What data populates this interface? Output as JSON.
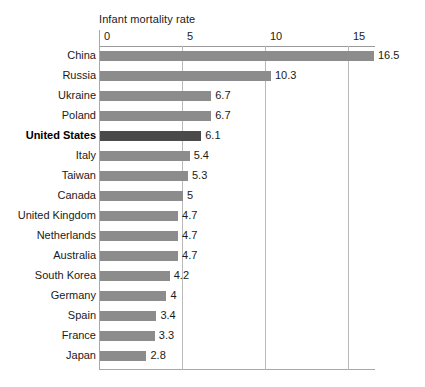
{
  "chart_data": {
    "type": "bar",
    "orientation": "horizontal",
    "title": "Infant mortality rate",
    "xlabel": "",
    "ylabel": "",
    "xlim": [
      0,
      16.6
    ],
    "xticks": [
      0,
      5,
      10,
      15
    ],
    "xtick_labels": [
      "0",
      "5",
      "10",
      "15"
    ],
    "grid": true,
    "legend": "none",
    "highlight_category": "United States",
    "colors": {
      "bar": "#8c8c8c",
      "bar_highlight": "#4a4a4a",
      "gridline": "#b9b9b9",
      "axis": "#9a9a9a",
      "background": "#ffffff",
      "text": "#1a1a1a"
    },
    "categories": [
      "China",
      "Russia",
      "Ukraine",
      "Poland",
      "United States",
      "Italy",
      "Taiwan",
      "Canada",
      "United Kingdom",
      "Netherlands",
      "Australia",
      "South Korea",
      "Germany",
      "Spain",
      "France",
      "Japan"
    ],
    "values": [
      16.5,
      10.3,
      6.7,
      6.7,
      6.1,
      5.4,
      5.3,
      5,
      4.7,
      4.7,
      4.7,
      4.2,
      4,
      3.4,
      3.3,
      2.8
    ],
    "value_labels": [
      "16.5",
      "10.3",
      "6.7",
      "6.7",
      "6.1",
      "5.4",
      "5.3",
      "5",
      "4.7",
      "4.7",
      "4.7",
      "4.2",
      "4",
      "3.4",
      "3.3",
      "2.8"
    ]
  }
}
